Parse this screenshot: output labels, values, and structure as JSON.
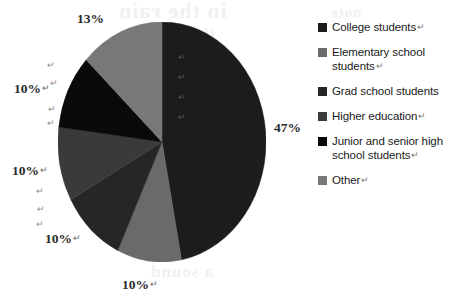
{
  "chart_data": {
    "type": "pie",
    "title": "",
    "legend_position": "right",
    "categories": [
      "College students",
      "Elementary school students",
      "Grad school students",
      "Higher education",
      "Junior and senior high school students",
      "Other"
    ],
    "values": [
      47,
      10,
      10,
      10,
      10,
      13
    ],
    "value_labels": [
      "47%",
      "10%",
      "10%",
      "10%",
      "10%",
      "13%"
    ],
    "unit": "%",
    "colors": [
      "#1c1c1c",
      "#6a6a6a",
      "#262626",
      "#3a3a3a",
      "#0a0a0a",
      "#787878"
    ],
    "start_angle_deg": 0,
    "direction": "clockwise",
    "grid": false
  },
  "pie": {
    "slices": [
      {
        "label": "College students",
        "value": 47,
        "display": "47%",
        "color": "#1c1c1c"
      },
      {
        "label": "Elementary school students",
        "value": 10,
        "display": "10%",
        "color": "#6a6a6a"
      },
      {
        "label": "Grad school students",
        "value": 10,
        "display": "10%",
        "color": "#262626"
      },
      {
        "label": "Higher education",
        "value": 10,
        "display": "10%",
        "color": "#3a3a3a"
      },
      {
        "label": "Junior and senior high school students",
        "value": 10,
        "display": "10%",
        "color": "#0a0a0a"
      },
      {
        "label": "Other",
        "value": 13,
        "display": "13%",
        "color": "#787878"
      }
    ],
    "labels": {
      "top": "13%",
      "right": "47%",
      "upper_left": "10%",
      "mid_left": "10%",
      "lower_left": "10%",
      "bottom": "10%"
    },
    "return_mark": "↵"
  },
  "legend": {
    "items": [
      {
        "label": "College students",
        "trailing": "↵",
        "color": "#1c1c1c"
      },
      {
        "label": "Elementary school students",
        "trailing": "↵",
        "color": "#6a6a6a"
      },
      {
        "label": "Grad school students",
        "trailing": "",
        "color": "#262626"
      },
      {
        "label": "Higher education",
        "trailing": "↵",
        "color": "#3a3a3a"
      },
      {
        "label": "Junior and senior high school students",
        "trailing": "↵",
        "color": "#0a0a0a"
      },
      {
        "label": "Other",
        "trailing": "↵",
        "color": "#787878"
      }
    ]
  },
  "artifacts": {
    "bleed_1": "in the rain",
    "bleed_2": "the sun",
    "bleed_3": "a sound",
    "bleed_4": "note",
    "stray_mark": "↵"
  }
}
